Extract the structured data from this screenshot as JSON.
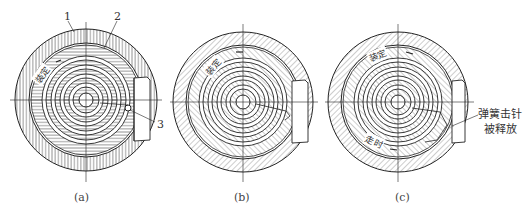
{
  "figure": {
    "panels": [
      {
        "id": "a",
        "caption": "(a)",
        "part_labels": [
          "1",
          "2",
          "3"
        ],
        "arc_label": "装定"
      },
      {
        "id": "b",
        "caption": "(b)",
        "arc_label": "装定"
      },
      {
        "id": "c",
        "caption": "(c)",
        "arc_label_top": "装定",
        "arc_label_bottom": "走时",
        "annotation_line1": "弹簧击针",
        "annotation_line2": "被释放"
      }
    ],
    "colors": {
      "line": "#222222",
      "hatch": "#555555",
      "background": "#ffffff"
    }
  }
}
